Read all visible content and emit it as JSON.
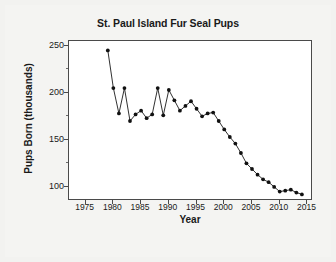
{
  "chart_data": {
    "type": "line",
    "title": "St. Paul Island Fur Seal Pups",
    "xlabel": "Year",
    "ylabel": "Pups Born (thousands)",
    "xlim": [
      1972,
      2016
    ],
    "ylim": [
      85,
      255
    ],
    "xticks": [
      1975,
      1980,
      1985,
      1990,
      1995,
      2000,
      2005,
      2010,
      2015
    ],
    "xtick_labels": [
      "1975",
      "1980",
      "1985",
      "1990",
      "1995",
      "2000",
      "2005",
      "2010",
      "2015"
    ],
    "yticks": [
      100,
      150,
      200,
      250
    ],
    "ytick_labels": [
      "100",
      "150",
      "200",
      "250"
    ],
    "yticks_minor": [
      125,
      175,
      225
    ],
    "grid": false,
    "legend": null,
    "marker": "filled-circle",
    "line_color": "#1a1a1a",
    "marker_color": "#111111",
    "x": [
      1979,
      1980,
      1981,
      1982,
      1983,
      1984,
      1985,
      1986,
      1987,
      1988,
      1989,
      1990,
      1991,
      1992,
      1993,
      1994,
      1995,
      1996,
      1997,
      1998,
      1999,
      2000,
      2001,
      2002,
      2003,
      2004,
      2005,
      2006,
      2007,
      2008,
      2009,
      2010,
      2011,
      2012,
      2013,
      2014
    ],
    "values": [
      245,
      205,
      178,
      205,
      170,
      177,
      181,
      173,
      177,
      205,
      176,
      203,
      192,
      181,
      186,
      191,
      183,
      175,
      178,
      179,
      170,
      161,
      153,
      146,
      136,
      125,
      119,
      113,
      108,
      105,
      100,
      95,
      96,
      97,
      94,
      92
    ]
  }
}
